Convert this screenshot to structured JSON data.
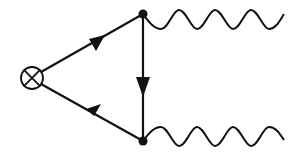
{
  "diagram": {
    "type": "feynman-diagram",
    "colors": {
      "ink": "#111111",
      "background": "#ffffff"
    },
    "operator_insertion": {
      "symbol": "circled-cross",
      "cx": 32,
      "cy": 78,
      "r": 11
    },
    "vertices": [
      {
        "id": "top",
        "x": 143,
        "y": 14
      },
      {
        "id": "bottom",
        "x": 143,
        "y": 141
      }
    ],
    "fermion_lines": [
      {
        "from": "operator",
        "to": "top",
        "arrow_direction": "toward-top"
      },
      {
        "from": "top",
        "to": "bottom",
        "arrow_direction": "downward"
      },
      {
        "from": "bottom",
        "to": "operator",
        "arrow_direction": "toward-operator"
      }
    ],
    "boson_lines": [
      {
        "from": "top",
        "style": "wavy",
        "end_x": 284
      },
      {
        "from": "bottom",
        "style": "wavy",
        "end_x": 284
      }
    ]
  }
}
